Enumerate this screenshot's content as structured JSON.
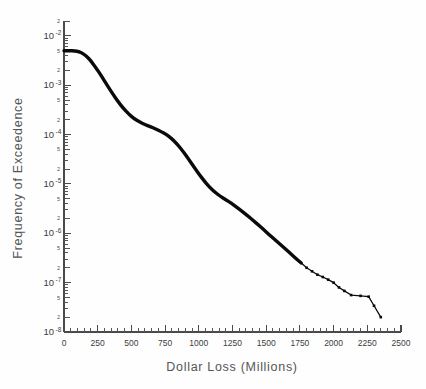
{
  "chart_data": {
    "type": "line",
    "title": "",
    "xlabel": "Dollar Loss (Millions)",
    "ylabel": "Frequency of Exceedence",
    "xlim": [
      0,
      2500
    ],
    "ylim": [
      1e-08,
      0.02
    ],
    "yscale": "log",
    "xscale": "linear",
    "grid": false,
    "legend": null,
    "x_major_ticks": [
      0,
      250,
      500,
      750,
      1000,
      1250,
      1500,
      1750,
      2000,
      2250,
      2500
    ],
    "x_major_tick_labels": [
      "0",
      "250",
      "500",
      "750",
      "1000",
      "1250",
      "1500",
      "1750",
      "2000",
      "2250",
      "2500"
    ],
    "x_minor_tick_interval": 50,
    "y_decade_labels": [
      {
        "mantissa": "10",
        "exponent": "-2",
        "value": 0.01
      },
      {
        "mantissa": "10",
        "exponent": "-3",
        "value": 0.001
      },
      {
        "mantissa": "10",
        "exponent": "-4",
        "value": 0.0001
      },
      {
        "mantissa": "10",
        "exponent": "-5",
        "value": 1e-05
      },
      {
        "mantissa": "10",
        "exponent": "-6",
        "value": 1e-06
      },
      {
        "mantissa": "10",
        "exponent": "-7",
        "value": 1e-07
      },
      {
        "mantissa": "10",
        "exponent": "-8",
        "value": 1e-08
      }
    ],
    "y_labeled_minor_ticks": [
      "2",
      "5"
    ],
    "series": [
      {
        "name": "Exceedence curve",
        "x": [
          0,
          40,
          80,
          110,
          140,
          170,
          200,
          240,
          280,
          320,
          360,
          400,
          440,
          480,
          520,
          560,
          600,
          640,
          680,
          720,
          760,
          800,
          840,
          880,
          920,
          960,
          1000,
          1040,
          1080,
          1120,
          1160,
          1200,
          1240,
          1280,
          1320,
          1360,
          1400,
          1440,
          1480,
          1520,
          1560,
          1600,
          1640,
          1680,
          1720,
          1760,
          1800,
          1840,
          1880,
          1920,
          1960,
          2000,
          2040,
          2080,
          2130,
          2200,
          2260,
          2300,
          2350
        ],
        "y": [
          0.005,
          0.005,
          0.00495,
          0.0048,
          0.0044,
          0.0038,
          0.0031,
          0.0022,
          0.0015,
          0.001,
          0.00068,
          0.00047,
          0.00034,
          0.00026,
          0.00021,
          0.00018,
          0.00016,
          0.000145,
          0.00013,
          0.000115,
          0.0001,
          8.2e-05,
          6.4e-05,
          4.7e-05,
          3.3e-05,
          2.3e-05,
          1.6e-05,
          1.15e-05,
          8.6e-06,
          6.8e-06,
          5.6e-06,
          4.8e-06,
          4.1e-06,
          3.4e-06,
          2.8e-06,
          2.3e-06,
          1.85e-06,
          1.5e-06,
          1.2e-06,
          9.5e-07,
          7.6e-07,
          6.1e-07,
          4.9e-07,
          3.9e-07,
          3.1e-07,
          2.5e-07,
          2e-07,
          1.7e-07,
          1.45e-07,
          1.3e-07,
          1.15e-07,
          1e-07,
          8e-08,
          6.8e-08,
          5.6e-08,
          5.4e-08,
          5.2e-08,
          3.4e-08,
          2e-08
        ]
      }
    ]
  },
  "axis_titles": {
    "x": "Dollar Loss (Millions)",
    "y": "Frequency of Exceedence"
  }
}
